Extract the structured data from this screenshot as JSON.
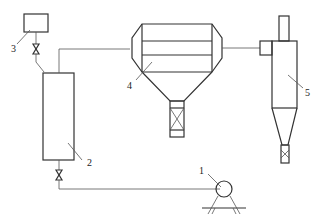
{
  "diagram": {
    "type": "process flow schematic",
    "labels": [
      {
        "id": "1",
        "text": "1",
        "component": "pump"
      },
      {
        "id": "2",
        "text": "2",
        "component": "vertical column"
      },
      {
        "id": "3",
        "text": "3",
        "component": "feed tank"
      },
      {
        "id": "4",
        "text": "4",
        "component": "drum/hopper vessel"
      },
      {
        "id": "5",
        "text": "5",
        "component": "cyclone separator"
      }
    ],
    "connections": [
      {
        "from": "3",
        "to": "2",
        "via": "valve"
      },
      {
        "from": "2",
        "to": "4"
      },
      {
        "from": "4",
        "to": "5"
      },
      {
        "from": "2",
        "to": "1",
        "via": "valve"
      }
    ],
    "colors": {
      "line": "#333333",
      "background": "#ffffff"
    }
  }
}
